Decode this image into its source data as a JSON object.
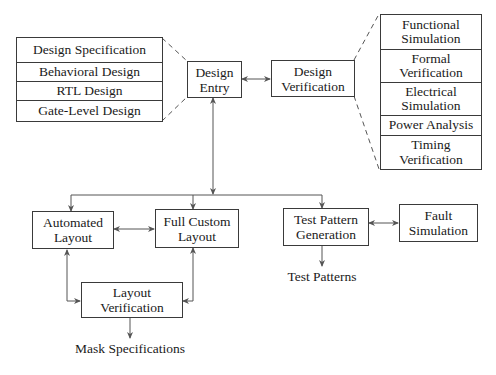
{
  "diagram": {
    "design_flow": {
      "design_entry": "Design\nEntry",
      "design_verification": "Design\nVerification"
    },
    "design_entry_methods": [
      "Design Specification",
      "Behavioral Design",
      "RTL Design",
      "Gate-Level Design"
    ],
    "verification_methods": [
      "Functional\nSimulation",
      "Formal\nVerification",
      "Electrical\nSimulation",
      "Power Analysis",
      "Timing\nVerification"
    ],
    "layout": {
      "automated": "Automated\nLayout",
      "full_custom": "Full Custom\nLayout",
      "verification": "Layout\nVerification",
      "output": "Mask Specifications"
    },
    "test": {
      "generation": "Test Pattern\nGeneration",
      "fault_sim": "Fault\nSimulation",
      "output": "Test Patterns"
    }
  }
}
